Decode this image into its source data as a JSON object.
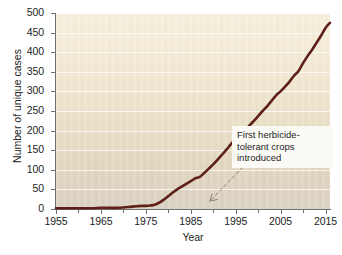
{
  "chart_data": {
    "type": "line",
    "title": "",
    "xlabel": "Year",
    "ylabel": "Number of unique cases",
    "xlim": [
      1955,
      2016
    ],
    "ylim": [
      0,
      500
    ],
    "grid": true,
    "legend": false,
    "line_color": "#5e2018",
    "plot_background_top": "#f7efdd",
    "plot_background_bottom": "#dbd2c6",
    "gridline_color": "#ffffff",
    "axis_color": "#6f6f6f",
    "xticks": [
      1955,
      1965,
      1975,
      1985,
      1995,
      2005,
      2015
    ],
    "xticks_minor": [
      1960,
      1970,
      1980,
      1990,
      2000,
      2010
    ],
    "yticks": [
      0,
      50,
      100,
      150,
      200,
      250,
      300,
      350,
      400,
      450,
      500
    ],
    "x": [
      1955,
      1957,
      1959,
      1961,
      1963,
      1965,
      1967,
      1969,
      1970,
      1971,
      1972,
      1973,
      1974,
      1975,
      1976,
      1977,
      1978,
      1979,
      1980,
      1981,
      1982,
      1983,
      1984,
      1985,
      1986,
      1987,
      1988,
      1989,
      1990,
      1991,
      1992,
      1993,
      1994,
      1995,
      1996,
      1997,
      1998,
      1999,
      2000,
      2001,
      2002,
      2003,
      2004,
      2005,
      2006,
      2007,
      2008,
      2009,
      2010,
      2011,
      2012,
      2013,
      2014,
      2015,
      2016
    ],
    "values": [
      2,
      2,
      2,
      2,
      2,
      3,
      3,
      3,
      4,
      5,
      6,
      7,
      8,
      8,
      9,
      11,
      16,
      24,
      33,
      42,
      50,
      57,
      64,
      71,
      78,
      82,
      92,
      103,
      114,
      126,
      139,
      152,
      166,
      178,
      190,
      198,
      212,
      224,
      237,
      250,
      262,
      276,
      290,
      300,
      312,
      325,
      340,
      352,
      372,
      390,
      406,
      424,
      442,
      462,
      475
    ],
    "annotations": [
      {
        "text_lines": [
          "First herbicide-",
          "tolerant crops",
          "introduced"
        ],
        "full_text": "First herbicide-tolerant crops introduced",
        "points_to_year": 1996,
        "points_to_value": 0,
        "arrow_style": "dashed"
      }
    ]
  }
}
